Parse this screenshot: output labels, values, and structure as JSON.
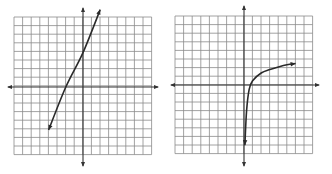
{
  "chart_data": [
    {
      "type": "line",
      "title": "",
      "xlabel": "",
      "ylabel": "",
      "grid": true,
      "grid_cells": 16,
      "xlim": [
        -8,
        8
      ],
      "ylim": [
        -8,
        8
      ],
      "description": "Straight line with arrows at both ends (linear function)",
      "series": [
        {
          "name": "linear",
          "x": [
            -4,
            -2,
            0,
            2
          ],
          "y": [
            -5,
            0,
            4,
            9
          ],
          "equation_estimate": "y = 2x + 4",
          "arrows": "both"
        }
      ]
    },
    {
      "type": "line",
      "title": "",
      "xlabel": "",
      "ylabel": "",
      "grid": true,
      "grid_cells": 16,
      "xlim": [
        -8,
        8
      ],
      "ylim": [
        -8,
        8
      ],
      "description": "Logarithmic-shaped curve, vertical asymptote near x=0, increasing slowly to the right",
      "series": [
        {
          "name": "logarithmic",
          "x": [
            0.1,
            0.3,
            0.6,
            1,
            2,
            3,
            4,
            5,
            6
          ],
          "y": [
            -7,
            -3,
            -0.5,
            0.5,
            1.4,
            1.8,
            2.1,
            2.35,
            2.5
          ],
          "arrows": "both"
        }
      ]
    }
  ],
  "graphs": [
    {
      "name": "Linear function graph"
    },
    {
      "name": "Logarithmic function graph"
    }
  ]
}
